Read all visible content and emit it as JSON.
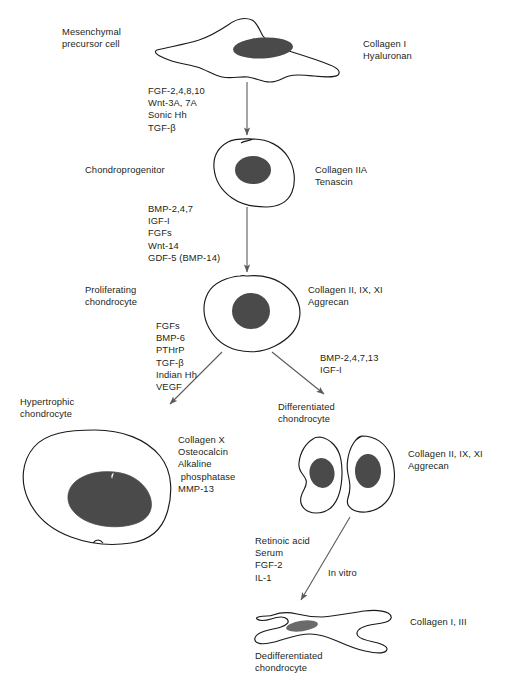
{
  "figure": {
    "domain": "biological-pathway-diagram",
    "title_visible": false,
    "colors": {
      "ink": "#231f20",
      "cell_outline": "#1a1a1a",
      "nucleus_fill": "#4a4a4a",
      "arrow": "#5a5a5a",
      "background": "#ffffff"
    }
  },
  "stages": [
    {
      "id": "mesenchymal",
      "name_label": "Mesenchymal\nprecursor cell",
      "markers_label": "Collagen I\nHyaluronan",
      "cell_shape": "stellate-flat-fibroblastic"
    },
    {
      "id": "chondroprogenitor",
      "name_label": "Chondroprogenitor",
      "markers_label": "Collagen IIA\nTenascin",
      "cell_shape": "round"
    },
    {
      "id": "proliferating",
      "name_label": "Proliferating\nchondrocyte",
      "markers_label": "Collagen II, IX, XI\nAggrecan",
      "cell_shape": "round-wide"
    },
    {
      "id": "hypertrophic",
      "name_label": "Hypertrophic\nchondrocyte",
      "markers_label": "Collagen X\nOsteocalcin\nAlkaline\n phosphatase\nMMP-13",
      "cell_shape": "large-round"
    },
    {
      "id": "differentiated",
      "name_label": "Differentiated\nchondrocyte",
      "markers_label": "Collagen II, IX, XI\nAggrecan",
      "cell_shape": "paired-ovals"
    },
    {
      "id": "dedifferentiated",
      "name_label": "Dedifferentiated\nchondrocyte",
      "markers_label": "Collagen I, III",
      "cell_shape": "elongated-fibroblastic"
    }
  ],
  "transitions": [
    {
      "id": "mesenchymal-to-chondroprogenitor",
      "factors_label": "FGF-2,4,8,10\nWnt-3A, 7A\nSonic Hh\nTGF-β",
      "direction": "vertical-down"
    },
    {
      "id": "chondroprogenitor-to-proliferating",
      "factors_label": "BMP-2,4,7\nIGF-I\nFGFs\nWnt-14\nGDF-5 (BMP-14)",
      "direction": "vertical-down"
    },
    {
      "id": "proliferating-to-hypertrophic",
      "factors_label": "FGFs\nBMP-6\nPTHrP\nTGF-β\nIndian Hh\nVEGF",
      "direction": "diagonal-down-left"
    },
    {
      "id": "proliferating-to-differentiated",
      "factors_label": "BMP-2,4,7,13\nIGF-I",
      "direction": "diagonal-down-right"
    },
    {
      "id": "differentiated-to-dedifferentiated",
      "factors_label": "Retinoic acid\nSerum\nFGF-2\nIL-1",
      "condition_label": "In vitro",
      "direction": "diagonal-down-left"
    }
  ]
}
